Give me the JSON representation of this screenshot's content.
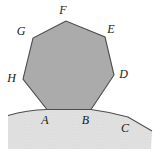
{
  "diagram": {
    "type": "geometry-figure",
    "shapes": [
      {
        "name": "heptagon",
        "vertex_labels_in_order": [
          "F",
          "G",
          "H",
          "A",
          "B",
          "D",
          "E"
        ],
        "fill": "#ababab"
      },
      {
        "name": "ground-region",
        "surface_label": "C",
        "fill": "#e2e2e2",
        "texture": "stipple"
      }
    ],
    "labels": {
      "A": "A",
      "B": "B",
      "C": "C",
      "D": "D",
      "E": "E",
      "F": "F",
      "G": "G",
      "H": "H"
    },
    "colors": {
      "heptagon_fill": "#ababab",
      "ground_fill": "#e2e2e2",
      "ground_dot": "#cccccc",
      "stroke": "#4d4d4d",
      "label": "#1a1a1a",
      "background": "#ffffff"
    }
  }
}
